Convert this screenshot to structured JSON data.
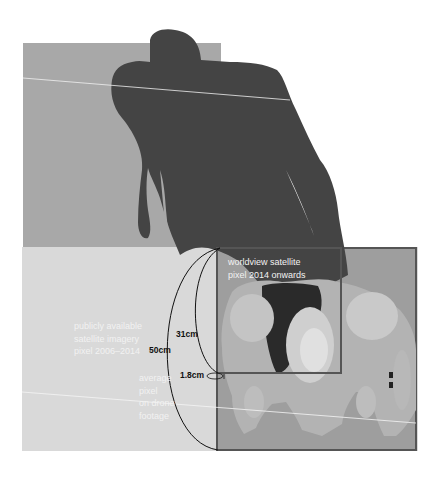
{
  "diagram": {
    "colors": {
      "background": "#ffffff",
      "upper_ground": "#a8a8a8",
      "lower_ground": "#d9d9d9",
      "satellite_box_fill": "#9e9e9e",
      "box_stroke": "#555555",
      "shadow": "#444444",
      "label_white": "#f2f2f2",
      "label_black": "#111111"
    },
    "labels": {
      "worldview": {
        "line1": "worldview satellite",
        "line2": "pixel 2014 onwards"
      },
      "public": {
        "line1": "publicly available",
        "line2": "satellite imagery",
        "line3": "pixel 2006–2014"
      },
      "drone": {
        "line1": "average",
        "line2": "pixel",
        "line3": "on drone",
        "line4": "footage"
      },
      "measure_50": "50cm",
      "measure_31": "31cm",
      "measure_1_8": "1.8cm"
    },
    "icons": {
      "figure": "person-top-down-silhouette",
      "shadow": "person-shadow-silhouette"
    }
  }
}
